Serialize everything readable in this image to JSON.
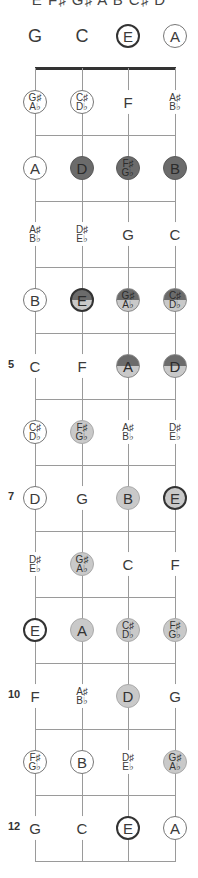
{
  "title": "E F♯ G♯ A B C♯ D",
  "strings": [
    "G",
    "C",
    "E",
    "A"
  ],
  "string_x": [
    35,
    82,
    128,
    175
  ],
  "colors": {
    "dark": "#6b6b6b",
    "light": "#c9c9c9",
    "line": "#9a9a9a",
    "nut": "#333333"
  },
  "fret_numbers": [
    {
      "fret": 5,
      "label": "5"
    },
    {
      "fret": 7,
      "label": "7"
    },
    {
      "fret": 10,
      "label": "10"
    },
    {
      "fret": 12,
      "label": "12"
    }
  ],
  "frets": [
    {
      "fret": 0,
      "notes": [
        {
          "label": "G",
          "style": "open"
        },
        {
          "label": "C",
          "style": "open"
        },
        {
          "label": "E",
          "style": "root"
        },
        {
          "label": "A",
          "style": "ring"
        }
      ]
    },
    {
      "fret": 1,
      "notes": [
        {
          "label": "G♯/A♭",
          "style": "ring"
        },
        {
          "label": "C♯/D♭",
          "style": "ring"
        },
        {
          "label": "F",
          "style": "plain"
        },
        {
          "label": "A♯/B♭",
          "style": "plain"
        }
      ]
    },
    {
      "fret": 2,
      "notes": [
        {
          "label": "A",
          "style": "ring"
        },
        {
          "label": "D",
          "style": "dark"
        },
        {
          "label": "F♯/G♭",
          "style": "dark"
        },
        {
          "label": "B",
          "style": "dark"
        }
      ]
    },
    {
      "fret": 3,
      "notes": [
        {
          "label": "A♯/B♭",
          "style": "plain"
        },
        {
          "label": "D♯/E♭",
          "style": "plain"
        },
        {
          "label": "G",
          "style": "plain"
        },
        {
          "label": "C",
          "style": "plain"
        }
      ]
    },
    {
      "fret": 4,
      "notes": [
        {
          "label": "B",
          "style": "ring"
        },
        {
          "label": "E",
          "style": "half root"
        },
        {
          "label": "G♯/A♭",
          "style": "half"
        },
        {
          "label": "C♯/D♭",
          "style": "half"
        }
      ]
    },
    {
      "fret": 5,
      "notes": [
        {
          "label": "C",
          "style": "plain"
        },
        {
          "label": "F",
          "style": "plain"
        },
        {
          "label": "A",
          "style": "half"
        },
        {
          "label": "D",
          "style": "half"
        }
      ]
    },
    {
      "fret": 6,
      "notes": [
        {
          "label": "C♯/D♭",
          "style": "ring"
        },
        {
          "label": "F♯/G♭",
          "style": "light"
        },
        {
          "label": "A♯/B♭",
          "style": "plain"
        },
        {
          "label": "D♯/E♭",
          "style": "plain"
        }
      ]
    },
    {
      "fret": 7,
      "notes": [
        {
          "label": "D",
          "style": "ring"
        },
        {
          "label": "G",
          "style": "plain"
        },
        {
          "label": "B",
          "style": "light"
        },
        {
          "label": "E",
          "style": "light root"
        }
      ]
    },
    {
      "fret": 8,
      "notes": [
        {
          "label": "D♯/E♭",
          "style": "plain"
        },
        {
          "label": "G♯/A♭",
          "style": "light"
        },
        {
          "label": "C",
          "style": "plain"
        },
        {
          "label": "F",
          "style": "plain"
        }
      ]
    },
    {
      "fret": 9,
      "notes": [
        {
          "label": "E",
          "style": "root"
        },
        {
          "label": "A",
          "style": "light"
        },
        {
          "label": "C♯/D♭",
          "style": "light"
        },
        {
          "label": "F♯/G♭",
          "style": "light"
        }
      ]
    },
    {
      "fret": 10,
      "notes": [
        {
          "label": "F",
          "style": "plain"
        },
        {
          "label": "A♯/B♭",
          "style": "plain"
        },
        {
          "label": "D",
          "style": "light"
        },
        {
          "label": "G",
          "style": "plain"
        }
      ]
    },
    {
      "fret": 11,
      "notes": [
        {
          "label": "F♯/G♭",
          "style": "ring"
        },
        {
          "label": "B",
          "style": "ring"
        },
        {
          "label": "D♯/E♭",
          "style": "plain"
        },
        {
          "label": "G♯/A♭",
          "style": "light"
        }
      ]
    },
    {
      "fret": 12,
      "notes": [
        {
          "label": "G",
          "style": "plain"
        },
        {
          "label": "C",
          "style": "plain"
        },
        {
          "label": "E",
          "style": "root"
        },
        {
          "label": "A",
          "style": "ring"
        }
      ]
    }
  ]
}
